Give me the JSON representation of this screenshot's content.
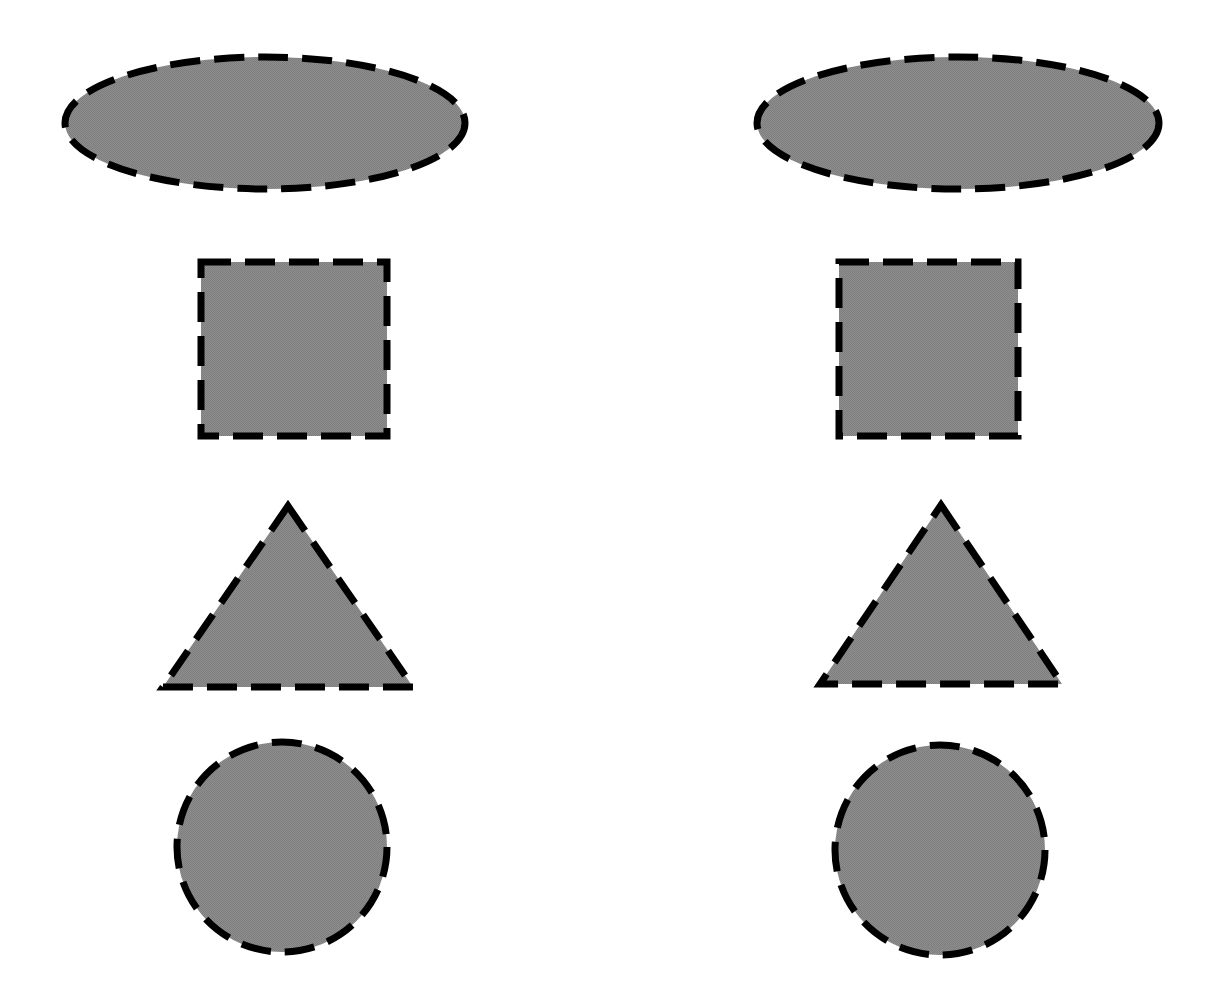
{
  "page": {
    "width": 1225,
    "height": 1004,
    "background_color": "#ffffff"
  },
  "style": {
    "fill_color": "#8a8a8a",
    "stroke_color": "#000000",
    "stroke_width": 7,
    "dash_pattern": "30 14",
    "fill_texture": "dithered-halftone-gray"
  },
  "columns": [
    {
      "name": "left-column",
      "center_x": 282
    },
    {
      "name": "right-column",
      "center_x": 940
    }
  ],
  "rows": [
    {
      "name": "ellipse-row",
      "shape": "ellipse"
    },
    {
      "name": "square-row",
      "shape": "square"
    },
    {
      "name": "triangle-row",
      "shape": "triangle"
    },
    {
      "name": "circle-row",
      "shape": "circle"
    }
  ],
  "shapes": [
    {
      "id": "ellipse-left",
      "label": "Ellipse",
      "type": "ellipse",
      "column": "left",
      "row": 0,
      "cx": 265,
      "cy": 123,
      "rx": 200,
      "ry": 66,
      "bounds": {
        "x": 65,
        "y": 57,
        "width": 400,
        "height": 132
      }
    },
    {
      "id": "ellipse-right",
      "label": "Ellipse",
      "type": "ellipse",
      "column": "right",
      "row": 0,
      "cx": 958,
      "cy": 123,
      "rx": 201,
      "ry": 66,
      "bounds": {
        "x": 757,
        "y": 57,
        "width": 402,
        "height": 132
      }
    },
    {
      "id": "square-left",
      "label": "Square",
      "type": "square",
      "column": "left",
      "row": 1,
      "bounds": {
        "x": 201,
        "y": 262,
        "width": 186,
        "height": 174
      }
    },
    {
      "id": "square-right",
      "label": "Square",
      "type": "square",
      "column": "right",
      "row": 1,
      "bounds": {
        "x": 839,
        "y": 262,
        "width": 179,
        "height": 174
      }
    },
    {
      "id": "triangle-left",
      "label": "Triangle",
      "type": "triangle",
      "column": "left",
      "row": 2,
      "points": "288,506 413,687 163,687",
      "bounds": {
        "x": 163,
        "y": 506,
        "width": 250,
        "height": 181
      }
    },
    {
      "id": "triangle-right",
      "label": "Triangle",
      "type": "triangle",
      "column": "right",
      "row": 2,
      "points": "941,505 1062,684 820,684",
      "bounds": {
        "x": 820,
        "y": 505,
        "width": 242,
        "height": 179
      }
    },
    {
      "id": "circle-left",
      "label": "Circle",
      "type": "circle",
      "column": "left",
      "row": 3,
      "cx": 282,
      "cy": 847,
      "r": 105,
      "bounds": {
        "x": 177,
        "y": 742,
        "width": 210,
        "height": 210
      }
    },
    {
      "id": "circle-right",
      "label": "Circle",
      "type": "circle",
      "column": "right",
      "row": 3,
      "cx": 940,
      "cy": 850,
      "r": 105,
      "bounds": {
        "x": 835,
        "y": 745,
        "width": 210,
        "height": 210
      }
    }
  ]
}
